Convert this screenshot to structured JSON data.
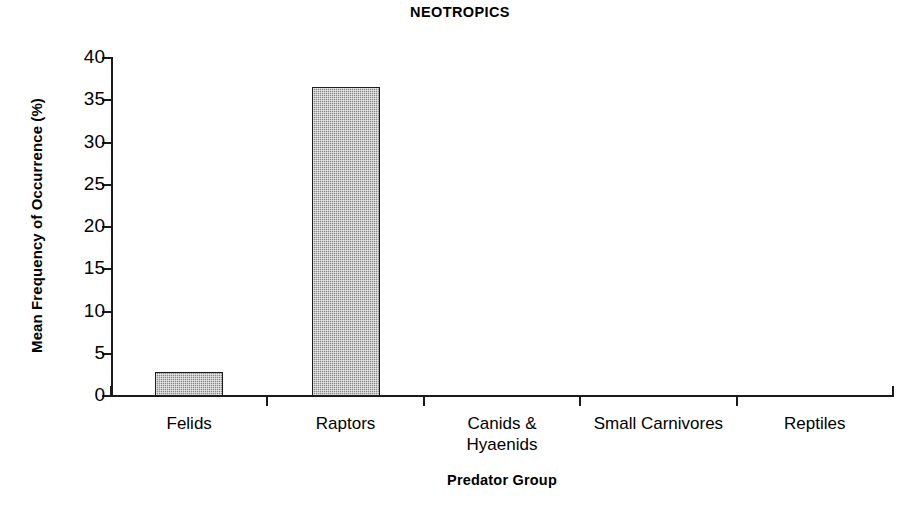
{
  "chart_data": {
    "type": "bar",
    "title": "NEOTROPICS",
    "xlabel": "Predator Group",
    "ylabel": "Mean Frequency of Occurrence (%)",
    "categories": [
      "Felids",
      "Raptors",
      "Canids &\nHyaenids",
      "Small Carnivores",
      "Reptiles"
    ],
    "values": [
      2.8,
      36.6,
      0,
      0,
      0
    ],
    "ylim": [
      0,
      40
    ],
    "yticks": [
      0,
      5,
      10,
      15,
      20,
      25,
      30,
      35,
      40
    ],
    "ytick_labels": [
      "0",
      "5",
      "10",
      "15",
      "20",
      "25",
      "30",
      "35",
      "40"
    ],
    "grid": false,
    "legend": "none",
    "bar_fill": "#8a8a8a",
    "bar_edge": "#1c1c1c",
    "axis_color": "#1a1a1a",
    "background": "#ffffff"
  }
}
